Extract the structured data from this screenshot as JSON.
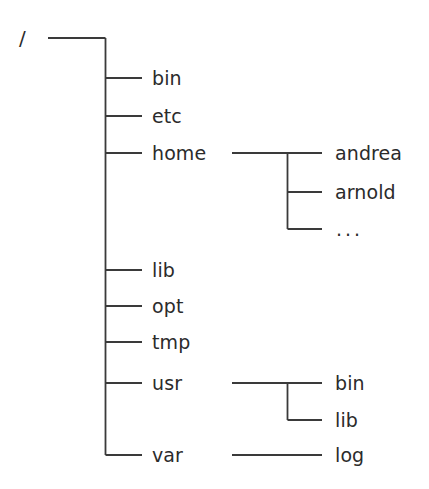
{
  "diagram": {
    "background_color": "#ffffff",
    "line_color": "#3a3a3a",
    "text_color": "#2b2b2b"
  },
  "root": {
    "label": "/"
  },
  "level1": [
    {
      "label": "bin"
    },
    {
      "label": "etc"
    },
    {
      "label": "home"
    },
    {
      "label": "lib"
    },
    {
      "label": "opt"
    },
    {
      "label": "tmp"
    },
    {
      "label": "usr"
    },
    {
      "label": "var"
    }
  ],
  "home_children": [
    {
      "label": "andrea"
    },
    {
      "label": "arnold"
    },
    {
      "label": "..."
    }
  ],
  "usr_children": [
    {
      "label": "bin"
    },
    {
      "label": "lib"
    }
  ],
  "var_children": [
    {
      "label": "log"
    }
  ]
}
